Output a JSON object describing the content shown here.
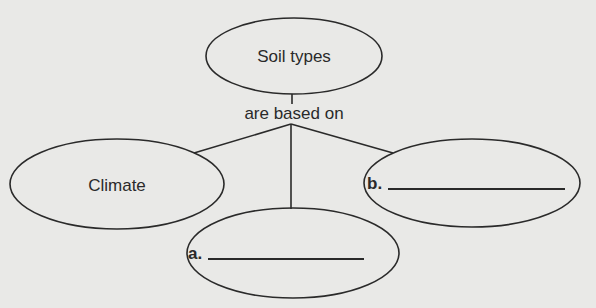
{
  "diagram": {
    "type": "concept-map",
    "root": {
      "label": "Soil types"
    },
    "link_label": "are based on",
    "children": [
      {
        "id": "climate",
        "label": "Climate",
        "blank": false
      },
      {
        "id": "a",
        "prefix": "a.",
        "blank": true,
        "value": ""
      },
      {
        "id": "b",
        "prefix": "b.",
        "blank": true,
        "value": ""
      }
    ],
    "colors": {
      "stroke": "#2a2a2a",
      "background": "#e9e9e7"
    }
  }
}
